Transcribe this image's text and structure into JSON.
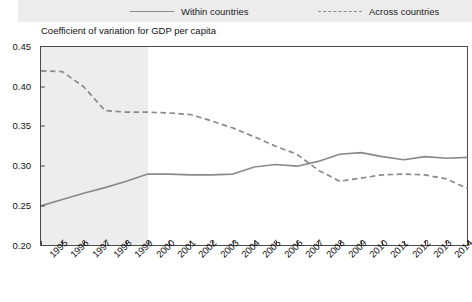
{
  "legend": {
    "entries": [
      {
        "label": "Within countries",
        "style": "solid",
        "color": "#8a8a8a",
        "icon": "solid-line-icon"
      },
      {
        "label": "Across countries",
        "style": "dashed",
        "color": "#8a8a8a",
        "icon": "dashed-line-icon"
      }
    ]
  },
  "chart_data": {
    "type": "line",
    "title": "Coefficient of variation for GDP per capita",
    "xlabel": "",
    "ylabel": "",
    "grid": false,
    "legend_position": "top",
    "ylim": [
      0.2,
      0.45
    ],
    "ytick_labels": [
      "0.45",
      "0.40",
      "0.35",
      "0.30",
      "0.25",
      "0.20"
    ],
    "ytick_values": [
      0.45,
      0.4,
      0.35,
      0.3,
      0.25,
      0.2
    ],
    "x": [
      1995,
      1996,
      1997,
      1998,
      1999,
      2000,
      2001,
      2002,
      2003,
      2004,
      2005,
      2006,
      2007,
      2008,
      2009,
      2010,
      2011,
      2012,
      2013,
      2014,
      2015
    ],
    "xtick_labels": [
      "1995",
      "1996",
      "1997",
      "1998",
      "1999",
      "2000",
      "2001",
      "2002",
      "2003",
      "2004",
      "2005",
      "2006",
      "2007",
      "2008",
      "2009",
      "2010",
      "2011",
      "2012",
      "2013",
      "2014",
      "2015"
    ],
    "shaded_region": {
      "from": 1995,
      "to": 2000,
      "color": "#ededee",
      "label": ""
    },
    "series": [
      {
        "name": "Within countries",
        "style": "solid",
        "color": "#8a8a8a",
        "values": [
          0.25,
          0.258,
          0.266,
          0.273,
          0.281,
          0.29,
          0.29,
          0.289,
          0.289,
          0.29,
          0.299,
          0.302,
          0.3,
          0.306,
          0.315,
          0.317,
          0.312,
          0.308,
          0.312,
          0.31,
          0.311
        ]
      },
      {
        "name": "Across countries",
        "style": "dashed",
        "color": "#8a8a8a",
        "values": [
          0.42,
          0.419,
          0.4,
          0.37,
          0.368,
          0.368,
          0.367,
          0.365,
          0.357,
          0.348,
          0.337,
          0.325,
          0.315,
          0.295,
          0.281,
          0.285,
          0.289,
          0.29,
          0.289,
          0.284,
          0.272
        ]
      }
    ]
  }
}
